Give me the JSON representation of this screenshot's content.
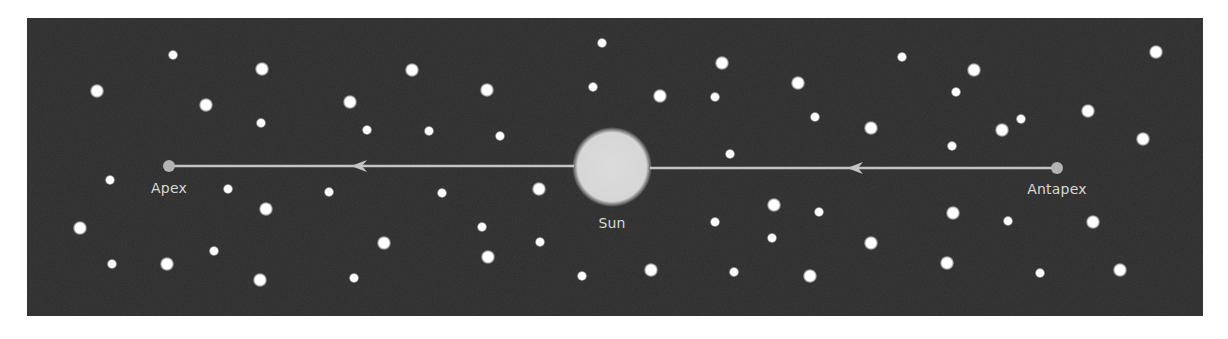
{
  "diagram": {
    "colors": {
      "background": "#2b2b2b",
      "star": "#ffffff",
      "sun": "#d9d9d9",
      "line": "#c4c4c4",
      "endpoint": "#b3b3b3",
      "label": "#d8d8d8"
    },
    "labels": {
      "apex": "Apex",
      "sun": "Sun",
      "antapex": "Antapex"
    },
    "sun": {
      "cx": 612,
      "cy": 167,
      "r": 36
    },
    "apex_point": {
      "cx": 169,
      "cy": 166,
      "r": 6
    },
    "antapex_point": {
      "cx": 1057,
      "cy": 168,
      "r": 6
    },
    "arrows": [
      {
        "name": "left-arrow",
        "from_x": 574,
        "to_x": 169,
        "y": 166,
        "head_x": 351
      },
      {
        "name": "right-arrow",
        "from_x": 1057,
        "to_x": 650,
        "y": 168,
        "head_x": 847
      }
    ],
    "stars": [
      {
        "x": 97,
        "y": 91,
        "r": 7
      },
      {
        "x": 173,
        "y": 55,
        "r": 5
      },
      {
        "x": 262,
        "y": 69,
        "r": 7
      },
      {
        "x": 206,
        "y": 105,
        "r": 7
      },
      {
        "x": 261,
        "y": 123,
        "r": 5
      },
      {
        "x": 350,
        "y": 102,
        "r": 7
      },
      {
        "x": 412,
        "y": 70,
        "r": 7
      },
      {
        "x": 487,
        "y": 90,
        "r": 7
      },
      {
        "x": 367,
        "y": 130,
        "r": 5
      },
      {
        "x": 429,
        "y": 131,
        "r": 5
      },
      {
        "x": 500,
        "y": 136,
        "r": 5
      },
      {
        "x": 602,
        "y": 43,
        "r": 5
      },
      {
        "x": 593,
        "y": 87,
        "r": 5
      },
      {
        "x": 660,
        "y": 96,
        "r": 7
      },
      {
        "x": 722,
        "y": 63,
        "r": 7
      },
      {
        "x": 715,
        "y": 97,
        "r": 5
      },
      {
        "x": 798,
        "y": 83,
        "r": 7
      },
      {
        "x": 815,
        "y": 117,
        "r": 5
      },
      {
        "x": 730,
        "y": 154,
        "r": 5
      },
      {
        "x": 902,
        "y": 57,
        "r": 5
      },
      {
        "x": 974,
        "y": 70,
        "r": 7
      },
      {
        "x": 956,
        "y": 92,
        "r": 5
      },
      {
        "x": 871,
        "y": 128,
        "r": 7
      },
      {
        "x": 1002,
        "y": 130,
        "r": 7
      },
      {
        "x": 1021,
        "y": 119,
        "r": 5
      },
      {
        "x": 952,
        "y": 146,
        "r": 5
      },
      {
        "x": 1156,
        "y": 52,
        "r": 7
      },
      {
        "x": 1088,
        "y": 111,
        "r": 7
      },
      {
        "x": 1143,
        "y": 139,
        "r": 7
      },
      {
        "x": 110,
        "y": 180,
        "r": 5
      },
      {
        "x": 228,
        "y": 189,
        "r": 5
      },
      {
        "x": 266,
        "y": 209,
        "r": 7
      },
      {
        "x": 80,
        "y": 228,
        "r": 7
      },
      {
        "x": 214,
        "y": 251,
        "r": 5
      },
      {
        "x": 112,
        "y": 264,
        "r": 5
      },
      {
        "x": 167,
        "y": 264,
        "r": 7
      },
      {
        "x": 260,
        "y": 280,
        "r": 7
      },
      {
        "x": 329,
        "y": 192,
        "r": 5
      },
      {
        "x": 442,
        "y": 193,
        "r": 5
      },
      {
        "x": 539,
        "y": 189,
        "r": 7
      },
      {
        "x": 482,
        "y": 227,
        "r": 5
      },
      {
        "x": 384,
        "y": 243,
        "r": 7
      },
      {
        "x": 540,
        "y": 242,
        "r": 5
      },
      {
        "x": 488,
        "y": 257,
        "r": 7
      },
      {
        "x": 354,
        "y": 278,
        "r": 5
      },
      {
        "x": 715,
        "y": 222,
        "r": 5
      },
      {
        "x": 774,
        "y": 205,
        "r": 7
      },
      {
        "x": 819,
        "y": 212,
        "r": 5
      },
      {
        "x": 772,
        "y": 238,
        "r": 5
      },
      {
        "x": 582,
        "y": 276,
        "r": 5
      },
      {
        "x": 651,
        "y": 270,
        "r": 7
      },
      {
        "x": 734,
        "y": 272,
        "r": 5
      },
      {
        "x": 810,
        "y": 276,
        "r": 7
      },
      {
        "x": 871,
        "y": 243,
        "r": 7
      },
      {
        "x": 953,
        "y": 213,
        "r": 7
      },
      {
        "x": 1008,
        "y": 221,
        "r": 5
      },
      {
        "x": 947,
        "y": 263,
        "r": 7
      },
      {
        "x": 1040,
        "y": 273,
        "r": 5
      },
      {
        "x": 1093,
        "y": 222,
        "r": 7
      },
      {
        "x": 1120,
        "y": 270,
        "r": 7
      }
    ]
  }
}
